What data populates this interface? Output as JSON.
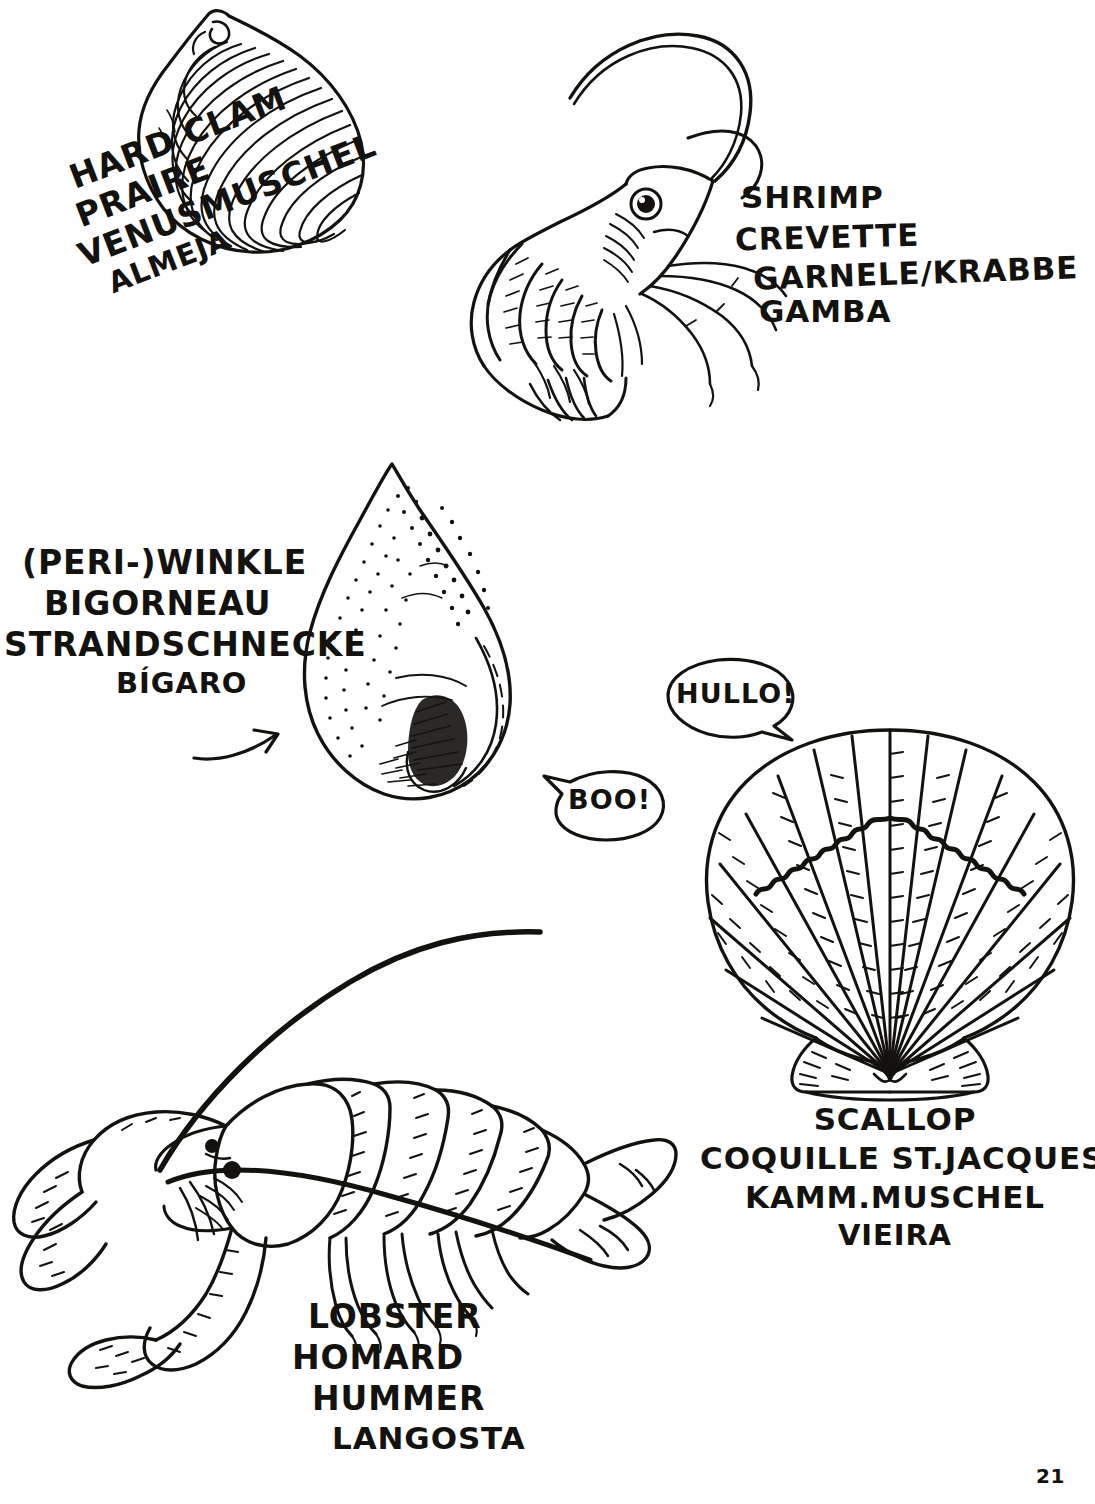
{
  "page": {
    "number": "21",
    "background_color": "#ffffff",
    "ink_color": "#14120f",
    "medium": "pen-and-ink hand drawing"
  },
  "specimens": {
    "hard_clam": {
      "icon": "clam-shell-icon",
      "names": {
        "english": "HARD CLAM",
        "french": "PRAIRE",
        "german": "VENUSMUSCHEL",
        "spanish": "ALMEJA"
      }
    },
    "shrimp": {
      "icon": "shrimp-icon",
      "names": {
        "english": "SHRIMP",
        "french": "CREVETTE",
        "german": "GARNELE/KRABBE",
        "spanish": "GAMBA"
      }
    },
    "periwinkle": {
      "icon": "periwinkle-snail-icon",
      "names": {
        "english": "(PERI-)WINKLE",
        "french": "BIGORNEAU",
        "german": "STRANDSCHNECKE",
        "spanish": "BÍGARO"
      }
    },
    "scallop": {
      "icon": "scallop-shell-icon",
      "names": {
        "english": "SCALLOP",
        "french": "COQUILLE ST.JACQUES",
        "german": "KAMM.MUSCHEL",
        "spanish": "VIEIRA"
      }
    },
    "lobster": {
      "icon": "lobster-icon",
      "names": {
        "english": "LOBSTER",
        "french": "HOMARD",
        "german": "HUMMER",
        "spanish": "LANGOSTA"
      }
    }
  },
  "speech_bubbles": [
    {
      "id": "hullo",
      "text": "HULLO!",
      "speaker": "scallop",
      "tail_direction": "right-down"
    },
    {
      "id": "boo",
      "text": "BOO!",
      "speaker": "periwinkle",
      "tail_direction": "left"
    }
  ],
  "annotations": {
    "bigaro_arrow": "curved-arrow-icon"
  }
}
